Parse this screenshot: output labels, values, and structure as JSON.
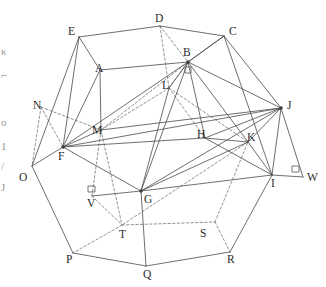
{
  "figure": {
    "type": "line-diagram",
    "width": 326,
    "height": 287,
    "background_color": "#ffffff",
    "solid_edge_color": "#4a4a4a",
    "hidden_edge_color": "#6e6e6e",
    "label_color": "#2b2b2b"
  },
  "vertices": [
    {
      "label": "A",
      "x": 100,
      "y": 70,
      "lx": 95,
      "ly": 63,
      "dot": false
    },
    {
      "label": "B",
      "x": 188,
      "y": 62,
      "lx": 183,
      "ly": 47,
      "dot": true
    },
    {
      "label": "C",
      "x": 224,
      "y": 36,
      "lx": 229,
      "ly": 26,
      "dot": false
    },
    {
      "label": "D",
      "x": 160,
      "y": 26,
      "lx": 155,
      "ly": 13,
      "dot": false
    },
    {
      "label": "E",
      "x": 79,
      "y": 37,
      "lx": 68,
      "ly": 26,
      "dot": false
    },
    {
      "label": "F",
      "x": 63,
      "y": 147,
      "lx": 58,
      "ly": 151,
      "dot": true
    },
    {
      "label": "G",
      "x": 141,
      "y": 191,
      "lx": 144,
      "ly": 194,
      "dot": true
    },
    {
      "label": "H",
      "x": 205,
      "y": 138,
      "lx": 197,
      "ly": 129,
      "dot": false
    },
    {
      "label": "I",
      "x": 272,
      "y": 175,
      "lx": 271,
      "ly": 178,
      "dot": false
    },
    {
      "label": "J",
      "x": 281,
      "y": 108,
      "lx": 287,
      "ly": 100,
      "dot": true
    },
    {
      "label": "K",
      "x": 248,
      "y": 142,
      "lx": 247,
      "ly": 132,
      "dot": false
    },
    {
      "label": "L",
      "x": 169,
      "y": 88,
      "lx": 162,
      "ly": 80,
      "dot": false
    },
    {
      "label": "M",
      "x": 101,
      "y": 130,
      "lx": 92,
      "ly": 125,
      "dot": false
    },
    {
      "label": "N",
      "x": 41,
      "y": 107,
      "lx": 33,
      "ly": 100,
      "dot": false
    },
    {
      "label": "O",
      "x": 32,
      "y": 166,
      "lx": 19,
      "ly": 172,
      "dot": false
    },
    {
      "label": "P",
      "x": 73,
      "y": 253,
      "lx": 66,
      "ly": 254,
      "dot": false
    },
    {
      "label": "Q",
      "x": 146,
      "y": 266,
      "lx": 143,
      "ly": 269,
      "dot": false
    },
    {
      "label": "R",
      "x": 230,
      "y": 252,
      "lx": 227,
      "ly": 254,
      "dot": false
    },
    {
      "label": "S",
      "x": 215,
      "y": 222,
      "lx": 200,
      "ly": 228,
      "dot": false
    },
    {
      "label": "T",
      "x": 122,
      "y": 225,
      "lx": 119,
      "ly": 229,
      "dot": false
    },
    {
      "label": "V",
      "x": 92,
      "y": 196,
      "lx": 87,
      "ly": 198,
      "dot": false
    },
    {
      "label": "W",
      "x": 303,
      "y": 177,
      "lx": 307,
      "ly": 172,
      "dot": false
    }
  ],
  "solid_edges": [
    [
      "E",
      "D"
    ],
    [
      "D",
      "C"
    ],
    [
      "E",
      "A"
    ],
    [
      "A",
      "B"
    ],
    [
      "B",
      "C"
    ],
    [
      "E",
      "F"
    ],
    [
      "E",
      "O"
    ],
    [
      "O",
      "F"
    ],
    [
      "O",
      "P"
    ],
    [
      "P",
      "Q"
    ],
    [
      "Q",
      "R"
    ],
    [
      "R",
      "I"
    ],
    [
      "I",
      "W"
    ],
    [
      "W",
      "J"
    ],
    [
      "J",
      "C"
    ],
    [
      "C",
      "I"
    ],
    [
      "C",
      "B"
    ],
    [
      "B",
      "J"
    ],
    [
      "B",
      "F"
    ],
    [
      "B",
      "G"
    ],
    [
      "B",
      "H"
    ],
    [
      "B",
      "K"
    ],
    [
      "B",
      "L"
    ],
    [
      "F",
      "G"
    ],
    [
      "F",
      "H"
    ],
    [
      "F",
      "J"
    ],
    [
      "F",
      "M"
    ],
    [
      "G",
      "J"
    ],
    [
      "G",
      "K"
    ],
    [
      "G",
      "I"
    ],
    [
      "G",
      "Q"
    ],
    [
      "G",
      "V"
    ],
    [
      "H",
      "K"
    ],
    [
      "H",
      "J"
    ],
    [
      "K",
      "J"
    ],
    [
      "K",
      "I"
    ],
    [
      "I",
      "J"
    ],
    [
      "A",
      "M"
    ],
    [
      "M",
      "J"
    ],
    [
      "L",
      "G"
    ],
    [
      "H",
      "I"
    ],
    [
      "A",
      "F"
    ]
  ],
  "dashed_edges": [
    [
      "D",
      "B"
    ],
    [
      "D",
      "L"
    ],
    [
      "N",
      "M"
    ],
    [
      "N",
      "F"
    ],
    [
      "N",
      "O"
    ],
    [
      "M",
      "L"
    ],
    [
      "L",
      "K"
    ],
    [
      "L",
      "H"
    ],
    [
      "M",
      "T"
    ],
    [
      "T",
      "S"
    ],
    [
      "T",
      "P"
    ],
    [
      "S",
      "R"
    ],
    [
      "S",
      "K"
    ],
    [
      "V",
      "T"
    ],
    [
      "M",
      "V"
    ],
    [
      "B",
      "M"
    ],
    [
      "L",
      "B"
    ],
    [
      "K",
      "T"
    ]
  ],
  "right_angle_marks": [
    {
      "at": "B",
      "note": "right angle below B"
    },
    {
      "at": "V",
      "note": "right angle at V"
    },
    {
      "at": "W",
      "note": "right angle at W"
    }
  ],
  "margin_text_fragments": [
    {
      "text": "κ",
      "x": 1,
      "y": 46
    },
    {
      "text": "⌐",
      "x": 1,
      "y": 70
    },
    {
      "text": "o",
      "x": 1,
      "y": 117
    },
    {
      "text": "1",
      "x": 1,
      "y": 141
    },
    {
      "text": "/",
      "x": 1,
      "y": 161
    },
    {
      "text": "J",
      "x": 1,
      "y": 182
    }
  ]
}
